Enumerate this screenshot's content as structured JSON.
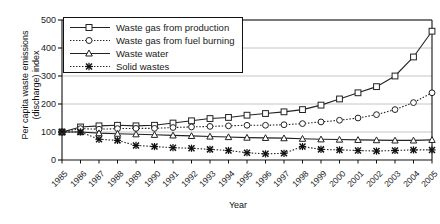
{
  "chart_data": {
    "type": "line",
    "title": "",
    "xlabel": "Year",
    "ylabel": "Per capita waste emissions (discharge) index",
    "ylim": [
      0,
      500
    ],
    "yticks": [
      0,
      100,
      200,
      300,
      400,
      500
    ],
    "grid": true,
    "legend_position": "top-left",
    "categories": [
      "1985",
      "1986",
      "1987",
      "1988",
      "1989",
      "1990",
      "1991",
      "1992",
      "1993",
      "1994",
      "1995",
      "1996",
      "1997",
      "1998",
      "1999",
      "2000",
      "2001",
      "2002",
      "2003",
      "2004",
      "2005"
    ],
    "series": [
      {
        "name": "Waste gas from production",
        "marker": "open-square",
        "linestyle": "solid",
        "values": [
          100,
          118,
          122,
          124,
          122,
          124,
          132,
          140,
          148,
          152,
          160,
          166,
          172,
          180,
          196,
          218,
          240,
          262,
          300,
          368,
          460
        ]
      },
      {
        "name": "Waste gas from fuel burning",
        "marker": "open-circle",
        "linestyle": "dotted",
        "values": [
          100,
          112,
          110,
          112,
          113,
          113,
          116,
          118,
          120,
          122,
          124,
          124,
          126,
          130,
          136,
          142,
          150,
          162,
          180,
          205,
          240
        ]
      },
      {
        "name": "Waste water",
        "marker": "open-triangle",
        "linestyle": "solid",
        "values": [
          100,
          100,
          96,
          94,
          92,
          90,
          88,
          86,
          84,
          82,
          80,
          79,
          78,
          76,
          74,
          73,
          72,
          71,
          70,
          70,
          72
        ]
      },
      {
        "name": "Solid wastes",
        "marker": "cross-x",
        "linestyle": "dotted",
        "values": [
          100,
          100,
          74,
          70,
          52,
          48,
          44,
          42,
          38,
          34,
          26,
          22,
          24,
          48,
          38,
          36,
          34,
          32,
          34,
          36,
          36
        ]
      }
    ]
  },
  "legend": {
    "items": [
      {
        "label": "Waste gas from production"
      },
      {
        "label": "Waste gas from fuel burning"
      },
      {
        "label": "Waste water"
      },
      {
        "label": "Solid wastes"
      }
    ]
  },
  "axes": {
    "y_title": "Per capita waste emissions (discharge) index",
    "x_title": "Year",
    "y_ticks": [
      "500",
      "400",
      "300",
      "200",
      "100",
      "0"
    ],
    "x_ticks": [
      "1985",
      "1986",
      "1987",
      "1988",
      "1989",
      "1990",
      "1991",
      "1992",
      "1993",
      "1994",
      "1995",
      "1996",
      "1997",
      "1998",
      "1999",
      "2000",
      "2001",
      "2002",
      "2003",
      "2004",
      "2005"
    ]
  },
  "colors": {
    "line": "#222222",
    "grid": "#bfbfbf",
    "axis": "#111111",
    "background": "#ffffff"
  }
}
